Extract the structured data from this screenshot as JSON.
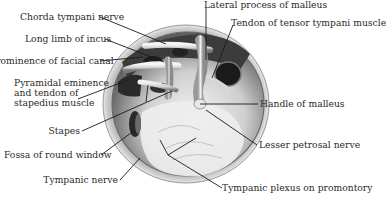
{
  "diagram": {
    "labels": [
      {
        "id": "chorda-tympani-nerve",
        "text": "Chorda tympani nerve"
      },
      {
        "id": "long-limb-of-incus",
        "text": "Long limb of incus"
      },
      {
        "id": "prominence-of-facial-canal",
        "text": "Prominence of facial canal"
      },
      {
        "id": "pyramidal-eminence",
        "text": "Pyramidal eminence"
      },
      {
        "id": "pyramidal-eminence-2",
        "text": "and tendon of"
      },
      {
        "id": "pyramidal-eminence-3",
        "text": "stapedius muscle"
      },
      {
        "id": "stapes",
        "text": "Stapes"
      },
      {
        "id": "fossa-of-round-window",
        "text": "Fossa of round window"
      },
      {
        "id": "tympanic-nerve",
        "text": "Tympanic nerve"
      },
      {
        "id": "lateral-process-of-malleus",
        "text": "Lateral process of malleus"
      },
      {
        "id": "tendon-of-tensor-tympani",
        "text": "Tendon of tensor tympani muscle"
      },
      {
        "id": "handle-of-malleus",
        "text": "Handle of malleus"
      },
      {
        "id": "lesser-petrosal-nerve",
        "text": "Lesser petrosal nerve"
      },
      {
        "id": "tympanic-plexus",
        "text": "Tympanic plexus on promontory"
      }
    ]
  }
}
